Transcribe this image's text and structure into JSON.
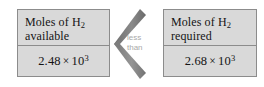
{
  "figure": {
    "type": "comparison-diagram",
    "relation": "less than",
    "accent_color": "#8c8c8c",
    "box_fill_color": "#d9d9d9",
    "label_color": "#a9a9a9"
  },
  "left_box": {
    "header_line1_pre": "Moles of H",
    "header_line1_sub": "2",
    "header_line2": "available",
    "value_mantissa": "2.48",
    "value_times": "×",
    "value_base": "10",
    "value_exponent": "3"
  },
  "right_box": {
    "header_line1_pre": "Moles of H",
    "header_line1_sub": "2",
    "header_line2": "required",
    "value_mantissa": "2.68",
    "value_times": "×",
    "value_base": "10",
    "value_exponent": "3"
  },
  "comparator": {
    "icon": "chevron-left-icon",
    "label_line1": "less",
    "label_line2": "than"
  }
}
